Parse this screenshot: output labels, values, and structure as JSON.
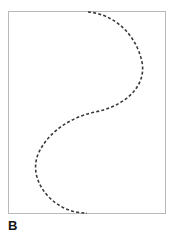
{
  "figure": {
    "panel_label": "B",
    "background_color": "#ffffff",
    "frame": {
      "border_color": "#b9b9b9",
      "fill_color": "#ffffff",
      "x": 8,
      "y": 11,
      "width": 158,
      "height": 203
    }
  },
  "chart_data": {
    "type": "line",
    "title": "B",
    "subtitle": "",
    "xlabel": "",
    "ylabel": "",
    "legend": [],
    "legend_position": "none",
    "grid": false,
    "axis_ticks": [],
    "tick_labels": [],
    "annotations": [],
    "xlim": [
      8,
      166
    ],
    "ylim": [
      11,
      214
    ],
    "series": [
      {
        "name": "dashed-s-curve",
        "style": "dashed",
        "color": "#3a3a3a",
        "line_width": 1.6,
        "dash_pattern": "3,2.2",
        "marker": "none",
        "x": [
          88,
          100,
          112,
          124,
          133,
          140,
          143,
          142,
          137,
          128,
          117,
          105,
          95,
          88,
          80,
          68,
          55,
          45,
          39,
          36,
          36,
          39,
          45,
          54,
          66,
          78,
          86
        ],
        "y": [
          12,
          14,
          19,
          28,
          39,
          52,
          66,
          78,
          88,
          96,
          103,
          108,
          111,
          115,
          119,
          126,
          136,
          147,
          156,
          164,
          173,
          182,
          191,
          199,
          207,
          211,
          213
        ]
      }
    ],
    "path_d": "M 88,12 C 114,14 136,34 142,62 C 147,88 122,107 95,112 C 72,117 50,130 39,152 C 29,173 42,197 64,208 C 72,212 80,213 87,213"
  }
}
